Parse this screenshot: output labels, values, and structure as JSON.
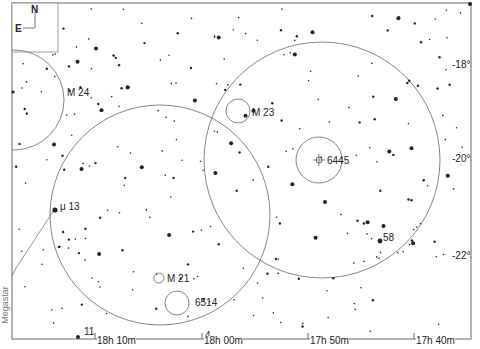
{
  "map": {
    "credit": "Megastar",
    "orientation": {
      "north": "N",
      "east": "E"
    },
    "ra_labels": [
      {
        "text": "18h 10m",
        "x": 97,
        "y": 336
      },
      {
        "text": "18h 00m",
        "x": 204,
        "y": 336
      },
      {
        "text": "17h 50m",
        "x": 310,
        "y": 336
      },
      {
        "text": "17h 40m",
        "x": 416,
        "y": 336
      }
    ],
    "dec_labels": [
      {
        "text": "-18°",
        "x": 452,
        "y": 60
      },
      {
        "text": "-20°",
        "x": 452,
        "y": 154
      },
      {
        "text": "-22°",
        "x": 452,
        "y": 251
      }
    ],
    "objects": [
      {
        "id": "M 24",
        "x": 67,
        "y": 88
      },
      {
        "id": "M 23",
        "x": 252,
        "y": 108
      },
      {
        "id": "6445",
        "x": 327,
        "y": 156
      },
      {
        "id": "μ 13",
        "x": 60,
        "y": 202
      },
      {
        "id": "58",
        "x": 383,
        "y": 233
      },
      {
        "id": "M 21",
        "x": 167,
        "y": 274
      },
      {
        "id": "6514",
        "x": 195,
        "y": 298
      },
      {
        "id": "11",
        "x": 84,
        "y": 327
      },
      {
        "id": "4",
        "x": 205,
        "y": 331
      }
    ],
    "circles": [
      {
        "cx": 14,
        "cy": 100,
        "r": 50
      },
      {
        "cx": 160,
        "cy": 215,
        "r": 110
      },
      {
        "cx": 322,
        "cy": 160,
        "r": 118
      },
      {
        "cx": 238,
        "cy": 111,
        "r": 12
      },
      {
        "cx": 319,
        "cy": 160,
        "r": 23
      },
      {
        "cx": 159,
        "cy": 278,
        "r": 5
      },
      {
        "cx": 177,
        "cy": 303,
        "r": 12
      }
    ]
  }
}
